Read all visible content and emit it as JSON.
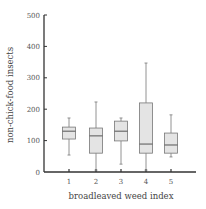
{
  "chart_data": {
    "type": "box",
    "title": "",
    "xlabel": "broadleaved weed index",
    "ylabel": "non-chick-food insects",
    "ylim": [
      0,
      500
    ],
    "yticks": [
      0,
      100,
      200,
      300,
      400,
      500
    ],
    "categories": [
      "1",
      "2",
      "3",
      "4",
      "5"
    ],
    "boxes": [
      {
        "category": "1",
        "whisker_low": 54,
        "q1": 105,
        "median": 130,
        "q3": 143,
        "whisker_high": 172
      },
      {
        "category": "2",
        "whisker_low": 6,
        "q1": 60,
        "median": 115,
        "q3": 140,
        "whisker_high": 223
      },
      {
        "category": "3",
        "whisker_low": 25,
        "q1": 99,
        "median": 130,
        "q3": 162,
        "whisker_high": 172
      },
      {
        "category": "4",
        "whisker_low": 6,
        "q1": 60,
        "median": 89,
        "q3": 220,
        "whisker_high": 347
      },
      {
        "category": "5",
        "whisker_low": 48,
        "q1": 60,
        "median": 86,
        "q3": 124,
        "whisker_high": 182
      }
    ],
    "grid": false,
    "legend": null
  },
  "colors": {
    "box_fill": "#e4e4e4",
    "box_stroke": "#777777",
    "axis": "#333333",
    "text": "#444444"
  }
}
